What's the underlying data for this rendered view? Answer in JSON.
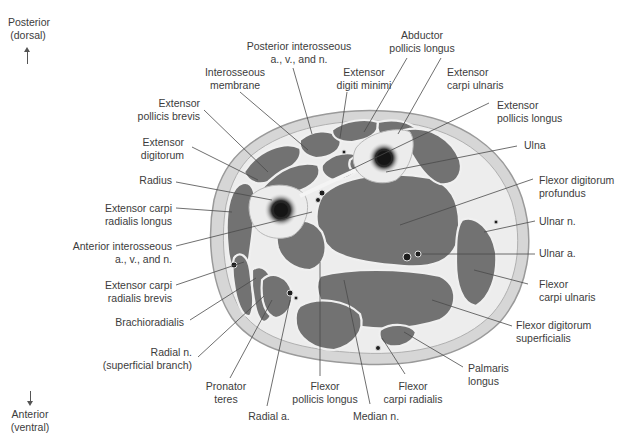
{
  "figure": {
    "orientation": {
      "top": "Posterior\n(dorsal)",
      "bottom": "Anterior\n(ventral)"
    },
    "colors": {
      "background": "#ffffff",
      "skin_fat": "#d8d8d8",
      "muscle": "#6f6f6f",
      "fascia": "#f2f2f2",
      "bone_cortex": "#ececec",
      "bone_marrow": "#1a1a1a",
      "leader_line": "#4a4a4a"
    },
    "labels": {
      "posterior_interosseous": "Posterior interosseous\na., v., and n.",
      "abductor_pollicis_longus": "Abductor\npollicis longus",
      "interosseous_membrane": "Interosseous\nmembrane",
      "extensor_digiti_minimi": "Extensor\ndigiti minimi",
      "extensor_carpi_ulnaris": "Extensor\ncarpi ulnaris",
      "extensor_pollicis_brevis": "Extensor\npollicis brevis",
      "extensor_pollicis_longus": "Extensor\npollicis longus",
      "extensor_digitorum": "Extensor\ndigitorum",
      "ulna": "Ulna",
      "radius": "Radius",
      "flexor_digitorum_profundus": "Flexor digitorum\nprofundus",
      "extensor_carpi_radialis_longus": "Extensor carpi\nradialis longus",
      "ulnar_n": "Ulnar n.",
      "anterior_interosseous": "Anterior interosseous\na., v., and n.",
      "ulnar_a": "Ulnar a.",
      "extensor_carpi_radialis_brevis": "Extensor carpi\nradialis brevis",
      "flexor_carpi_ulnaris": "Flexor\ncarpi ulnaris",
      "brachioradialis": "Brachioradialis",
      "flexor_digitorum_superficialis": "Flexor digitorum\nsuperficialis",
      "radial_n": "Radial n.\n(superficial branch)",
      "palmaris_longus": "Palmaris\nlongus",
      "pronator_teres": "Pronator\nteres",
      "flexor_pollicis_longus": "Flexor\npollicis longus",
      "flexor_carpi_radialis": "Flexor\ncarpi radialis",
      "radial_a": "Radial a.",
      "median_n": "Median n."
    }
  }
}
